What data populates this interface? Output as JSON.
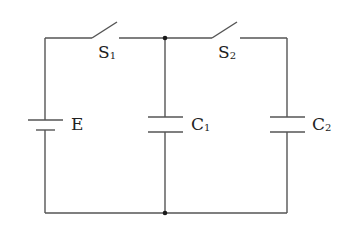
{
  "diagram": {
    "type": "circuit",
    "colors": {
      "wire": "#555555",
      "junction": "#1a1a1a",
      "label": "#222222",
      "background": "#ffffff"
    },
    "components": [
      {
        "id": "E",
        "kind": "battery",
        "label": "E",
        "label_main": "E",
        "label_sub": ""
      },
      {
        "id": "S1",
        "kind": "switch",
        "state": "open",
        "label": "S1",
        "label_main": "S",
        "label_sub": "1"
      },
      {
        "id": "S2",
        "kind": "switch",
        "state": "open",
        "label": "S2",
        "label_main": "S",
        "label_sub": "2"
      },
      {
        "id": "C1",
        "kind": "capacitor",
        "label": "C1",
        "label_main": "C",
        "label_sub": "1"
      },
      {
        "id": "C2",
        "kind": "capacitor",
        "label": "C2",
        "label_main": "C",
        "label_sub": "2"
      }
    ],
    "junctions": [
      {
        "id": "top-junction",
        "between": [
          "S1",
          "C1",
          "S2"
        ]
      },
      {
        "id": "bottom-junction",
        "between": [
          "E",
          "C1",
          "C2"
        ]
      }
    ],
    "topology": "E in series with S1 charges C1; S2 connects C1 in parallel with C2"
  }
}
